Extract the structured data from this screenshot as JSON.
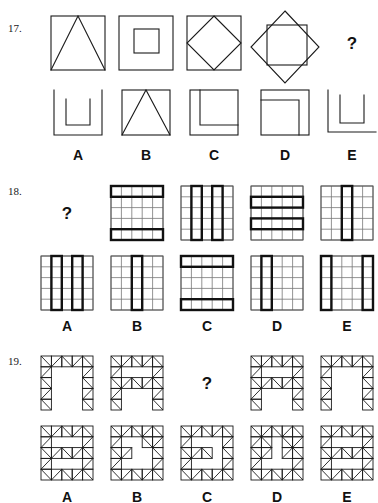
{
  "page": {
    "background_color": "#ffffff",
    "ink_color": "#1a1a1a"
  },
  "questions": [
    {
      "number": "17.",
      "question_mark": "?",
      "stimulus_name": "square-figures-sequence",
      "stimulus": [
        {
          "name": "square-with-inscribed-triangle",
          "figure": "square+triangle"
        },
        {
          "name": "square-with-inner-square",
          "figure": "square+inner-square"
        },
        {
          "name": "square-with-inscribed-diamond",
          "figure": "square+diamond"
        },
        {
          "name": "diamond-with-inner-square",
          "figure": "diamond+square"
        },
        {
          "name": "missing-figure",
          "figure": "question"
        }
      ],
      "options": [
        {
          "label": "A",
          "name": "option-a-u-inside-bracket",
          "figure": "bracket+u"
        },
        {
          "label": "B",
          "name": "option-b-square-with-triangle",
          "figure": "square+triangle"
        },
        {
          "label": "C",
          "name": "option-c-square-with-offset-corner",
          "figure": "square+corner"
        },
        {
          "label": "D",
          "name": "option-d-square-with-inner-corner",
          "figure": "square+innercorner"
        },
        {
          "label": "E",
          "name": "option-e-open-u-on-line",
          "figure": "line+u"
        }
      ]
    },
    {
      "number": "18.",
      "question_mark": "?",
      "stimulus_name": "grid-figures-sequence",
      "grid_size": 5,
      "stimulus": [
        {
          "name": "missing-figure",
          "figure": "question"
        },
        {
          "name": "grid-bold-rows-1-and-5",
          "bold_rows": [
            1,
            5
          ],
          "bold_cols": []
        },
        {
          "name": "grid-bold-cols-2-and-4",
          "bold_rows": [],
          "bold_cols": [
            2,
            4
          ]
        },
        {
          "name": "grid-bold-rows-2-and-4",
          "bold_rows": [
            2,
            4
          ],
          "bold_cols": []
        },
        {
          "name": "grid-bold-col-3",
          "bold_rows": [],
          "bold_cols": [
            3
          ]
        }
      ],
      "options": [
        {
          "label": "A",
          "name": "option-a-grid-bold-cols-2-4",
          "bold_rows": [],
          "bold_cols": [
            2,
            4
          ]
        },
        {
          "label": "B",
          "name": "option-b-grid-bold-col-3",
          "bold_rows": [],
          "bold_cols": [
            3
          ]
        },
        {
          "label": "C",
          "name": "option-c-grid-bold-rows-1-5",
          "bold_rows": [
            1,
            5
          ],
          "bold_cols": []
        },
        {
          "label": "D",
          "name": "option-d-grid-bold-col-2",
          "bold_rows": [],
          "bold_cols": [
            2
          ]
        },
        {
          "label": "E",
          "name": "option-e-grid-bold-cols-1-5",
          "bold_rows": [],
          "bold_cols": [
            1,
            5
          ]
        }
      ]
    },
    {
      "number": "19.",
      "question_mark": "?",
      "stimulus_name": "hatched-block-sequence",
      "grid_size": 5,
      "stimulus": [
        {
          "name": "arch-shape-n",
          "pattern": [
            [
              1,
              1,
              1,
              1,
              1
            ],
            [
              1,
              0,
              0,
              0,
              1
            ],
            [
              1,
              0,
              0,
              0,
              1
            ],
            [
              1,
              0,
              0,
              0,
              1
            ],
            [
              1,
              0,
              0,
              0,
              1
            ]
          ]
        },
        {
          "name": "a-shape",
          "pattern": [
            [
              1,
              1,
              1,
              1,
              1
            ],
            [
              1,
              0,
              0,
              0,
              1
            ],
            [
              1,
              1,
              1,
              1,
              1
            ],
            [
              1,
              0,
              0,
              0,
              1
            ],
            [
              1,
              0,
              0,
              0,
              1
            ]
          ]
        },
        {
          "name": "missing-figure",
          "figure": "question"
        },
        {
          "name": "a-shape-variant",
          "pattern": [
            [
              1,
              1,
              1,
              1,
              1
            ],
            [
              1,
              0,
              0,
              0,
              1
            ],
            [
              1,
              1,
              1,
              1,
              1
            ],
            [
              1,
              0,
              0,
              0,
              1
            ],
            [
              1,
              0,
              0,
              0,
              1
            ]
          ]
        },
        {
          "name": "arch-shape-n-variant",
          "pattern": [
            [
              1,
              1,
              1,
              1,
              1
            ],
            [
              1,
              0,
              0,
              0,
              1
            ],
            [
              1,
              0,
              0,
              0,
              1
            ],
            [
              1,
              0,
              0,
              0,
              1
            ],
            [
              1,
              0,
              0,
              0,
              1
            ]
          ]
        }
      ],
      "options": [
        {
          "label": "A",
          "name": "option-a-hatched-block",
          "pattern": [
            [
              1,
              1,
              1,
              1,
              1
            ],
            [
              1,
              0,
              0,
              0,
              1
            ],
            [
              1,
              1,
              1,
              1,
              1
            ],
            [
              1,
              0,
              0,
              0,
              1
            ],
            [
              1,
              1,
              1,
              1,
              1
            ]
          ]
        },
        {
          "label": "B",
          "name": "option-b-hatched-block",
          "pattern": [
            [
              1,
              1,
              1,
              1,
              1
            ],
            [
              1,
              0,
              0,
              1,
              1
            ],
            [
              1,
              1,
              0,
              0,
              1
            ],
            [
              1,
              0,
              0,
              0,
              1
            ],
            [
              1,
              1,
              1,
              1,
              1
            ]
          ]
        },
        {
          "label": "C",
          "name": "option-c-hatched-block",
          "pattern": [
            [
              1,
              1,
              1,
              1,
              1
            ],
            [
              1,
              0,
              0,
              0,
              1
            ],
            [
              1,
              1,
              1,
              0,
              1
            ],
            [
              1,
              0,
              0,
              0,
              1
            ],
            [
              1,
              1,
              1,
              1,
              1
            ]
          ]
        },
        {
          "label": "D",
          "name": "option-d-hatched-block",
          "pattern": [
            [
              1,
              1,
              1,
              1,
              1
            ],
            [
              1,
              1,
              0,
              1,
              1
            ],
            [
              1,
              1,
              0,
              1,
              1
            ],
            [
              1,
              0,
              0,
              0,
              1
            ],
            [
              1,
              1,
              1,
              1,
              1
            ]
          ]
        },
        {
          "label": "E",
          "name": "option-e-hatched-block",
          "pattern": [
            [
              1,
              1,
              1,
              1,
              1
            ],
            [
              1,
              0,
              0,
              0,
              1
            ],
            [
              1,
              1,
              1,
              1,
              1
            ],
            [
              1,
              0,
              0,
              0,
              1
            ],
            [
              1,
              1,
              1,
              1,
              1
            ]
          ]
        }
      ]
    }
  ]
}
